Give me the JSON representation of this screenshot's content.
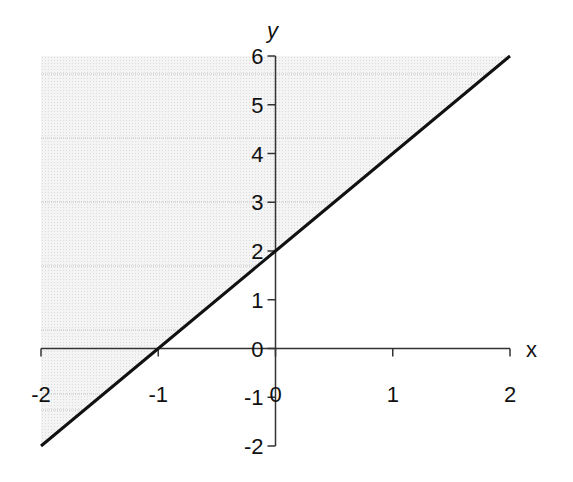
{
  "chart_data": {
    "type": "line",
    "title": "",
    "xlabel": "x",
    "ylabel": "y",
    "xlim": [
      -2,
      2
    ],
    "ylim": [
      -2,
      6
    ],
    "x_ticks": [
      -2,
      -1,
      0,
      1,
      2
    ],
    "y_ticks": [
      -2,
      -1,
      0,
      1,
      2,
      3,
      4,
      5,
      6
    ],
    "x_tick_labels": [
      "-2",
      "-1",
      "0",
      "1",
      "2"
    ],
    "y_tick_labels": [
      "-2",
      "-1",
      "0",
      "1",
      "2",
      "3",
      "4",
      "5",
      "6"
    ],
    "series": [
      {
        "name": "y = 2x + 2",
        "x": [
          -2,
          -1,
          0,
          1,
          2
        ],
        "values": [
          -2,
          0,
          2,
          4,
          6
        ],
        "color": "#111111"
      }
    ],
    "shaded_region": {
      "description": "region above the line y = 2x + 2 (y > 2x + 2)",
      "fill": "#ececec"
    },
    "grid": true,
    "legend": "none"
  },
  "colors": {
    "line": "#111111",
    "axis": "#333333",
    "shade": "#ededed",
    "grid": "#c4c4c4"
  }
}
